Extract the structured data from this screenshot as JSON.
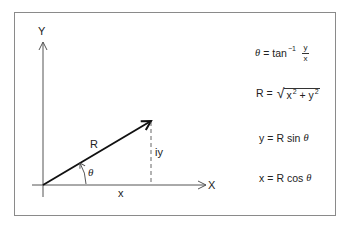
{
  "diagram": {
    "title": "",
    "axes": {
      "y_label": "Y",
      "x_label": "X"
    },
    "vector": {
      "label": "R",
      "angle_label": "θ"
    },
    "components": {
      "horizontal_label": "x",
      "vertical_label": "iy"
    },
    "colors": {
      "frame": "#8a8a8a",
      "axis": "#555555",
      "vector": "#111111",
      "text": "#222222"
    }
  },
  "formulas": [
    {
      "id": "theta",
      "lhs": "θ",
      "eq": "=",
      "func": "tan",
      "sup": "−1",
      "frac_num": "y",
      "frac_den": "x"
    },
    {
      "id": "radius",
      "lhs": "R",
      "eq": "=",
      "radicand_x": "x",
      "sup_x": "2",
      "plus": "+",
      "radicand_y": "y",
      "sup_y": "2"
    },
    {
      "id": "y-component",
      "lhs": "y",
      "eq": "=",
      "rhs_r": "R",
      "func": "sin",
      "arg": "θ"
    },
    {
      "id": "x-component",
      "lhs": "x",
      "eq": "=",
      "rhs_r": "R",
      "func": "cos",
      "arg": "θ"
    }
  ]
}
